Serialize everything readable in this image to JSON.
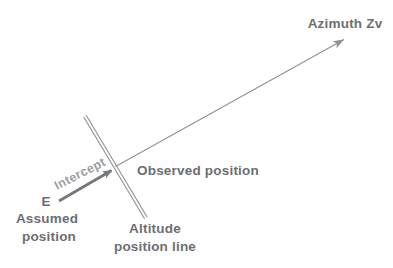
{
  "diagram": {
    "type": "celestial-navigation-intercept-diagram",
    "labels": {
      "azimuth": "Azimuth Zv",
      "observed_position": "Observed position",
      "intercept": "Intercept",
      "assumed_marker": "E",
      "assumed_position": [
        "Assumed",
        "position"
      ],
      "altitude_position_line": [
        "Altitude",
        "position line"
      ]
    },
    "colors": {
      "background": "#ffffff",
      "thin_line": "#909195",
      "double_line": "#909195",
      "intercept_arrow": "#77787c",
      "label_text": "#6d6e72",
      "intercept_text": "#9d9ea2"
    }
  }
}
